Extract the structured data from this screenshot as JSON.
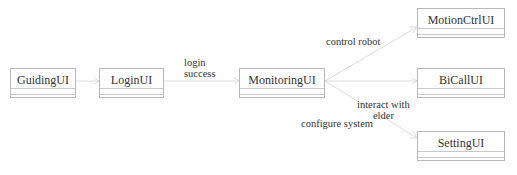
{
  "diagram": {
    "type": "uml-class-navigation",
    "nodes": [
      {
        "id": "guiding",
        "label": "GuidingUI"
      },
      {
        "id": "login",
        "label": "LoginUI"
      },
      {
        "id": "monitoring",
        "label": "MonitoringUI"
      },
      {
        "id": "motion",
        "label": "MotionCtrlUI"
      },
      {
        "id": "bicall",
        "label": "BiCallUI"
      },
      {
        "id": "setting",
        "label": "SettingUI"
      }
    ],
    "edges": [
      {
        "from": "guiding",
        "to": "login",
        "label": ""
      },
      {
        "from": "login",
        "to": "monitoring",
        "label": "login success",
        "label_lines": [
          "login",
          "success"
        ]
      },
      {
        "from": "monitoring",
        "to": "motion",
        "label": "control robot"
      },
      {
        "from": "monitoring",
        "to": "bicall",
        "label": "interact with elder",
        "label_lines": [
          "interact with",
          "elder"
        ]
      },
      {
        "from": "monitoring",
        "to": "setting",
        "label": "configure system"
      }
    ],
    "colors": {
      "line": "#dcdcdc",
      "box_border": "#b8b8b8",
      "text": "#333333"
    }
  }
}
